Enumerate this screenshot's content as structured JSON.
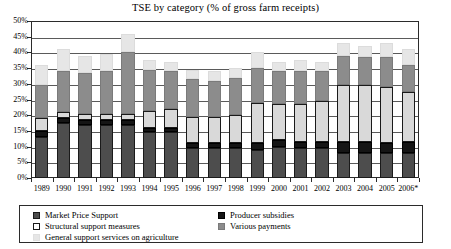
{
  "chart_data": {
    "type": "bar",
    "stacked": true,
    "title": "TSE by category (% of gross farm receipts)",
    "xlabel": "",
    "ylabel": "",
    "ylim": [
      0,
      50
    ],
    "ytick_labels": [
      "50%",
      "45%",
      "40%",
      "35%",
      "30%",
      "25%",
      "20%",
      "15%",
      "10%",
      "5%",
      "0%"
    ],
    "ytick_values": [
      50,
      45,
      40,
      35,
      30,
      25,
      20,
      15,
      10,
      5,
      0
    ],
    "grid": true,
    "legend_position": "bottom",
    "categories": [
      "1989",
      "1990",
      "1991",
      "1992",
      "1993",
      "1994",
      "1995",
      "1996",
      "1997",
      "1998",
      "1999",
      "2000",
      "2001",
      "2002",
      "2003",
      "2004",
      "2005",
      "2006*"
    ],
    "series": [
      {
        "name": "Market Price Support",
        "color": "#4d4d4d",
        "values": [
          13.0,
          17.5,
          17.0,
          17.0,
          17.0,
          14.5,
          14.5,
          9.5,
          9.5,
          9.5,
          9.0,
          10.0,
          9.5,
          9.5,
          8.0,
          8.0,
          8.0,
          8.0
        ]
      },
      {
        "name": "Producer subsidies",
        "color": "#151515",
        "values": [
          2.0,
          1.5,
          1.5,
          1.5,
          1.5,
          1.5,
          1.5,
          1.5,
          1.5,
          1.5,
          2.0,
          2.0,
          2.0,
          2.0,
          3.5,
          3.5,
          3.0,
          3.5
        ]
      },
      {
        "name": "Structural support measures",
        "color": "#ffffff",
        "values": [
          4.0,
          2.0,
          2.0,
          2.0,
          2.0,
          5.5,
          6.0,
          8.5,
          8.5,
          9.0,
          13.0,
          11.5,
          12.0,
          13.0,
          18.0,
          18.0,
          18.0,
          16.0
        ]
      },
      {
        "name": "Various payments",
        "color": "#8c8c8c",
        "values": [
          10.5,
          13.0,
          13.0,
          13.5,
          19.5,
          13.0,
          12.0,
          12.0,
          11.5,
          12.0,
          11.0,
          10.5,
          10.5,
          9.5,
          9.5,
          9.0,
          9.5,
          8.5
        ]
      },
      {
        "name": "General support services on agriculture",
        "color": "#e6e6e6",
        "values": [
          6.5,
          7.0,
          5.5,
          5.5,
          6.0,
          3.0,
          3.0,
          3.0,
          3.0,
          3.0,
          5.0,
          3.0,
          3.5,
          3.0,
          4.0,
          3.5,
          4.5,
          5.0
        ]
      }
    ]
  },
  "legend": {
    "items": [
      {
        "label": "Market Price Support",
        "swatch": "mps"
      },
      {
        "label": "Producer subsidies",
        "swatch": "prod"
      },
      {
        "label": "Structural support measures",
        "swatch": "ssm"
      },
      {
        "label": "Various payments",
        "swatch": "var"
      },
      {
        "label": "General support services on agriculture",
        "swatch": "gss"
      }
    ]
  }
}
